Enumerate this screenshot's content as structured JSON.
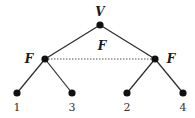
{
  "diagram": {
    "type": "tree",
    "root": {
      "id": "root",
      "label": "V",
      "x": 100,
      "y": 25,
      "label_x": 100,
      "label_y": 16
    },
    "internal": [
      {
        "id": "left",
        "label": "F",
        "x": 45,
        "y": 59,
        "label_x": 29,
        "label_y": 63
      },
      {
        "id": "right",
        "label": "F",
        "x": 155,
        "y": 59,
        "label_x": 171,
        "label_y": 63
      }
    ],
    "dotted_edge": {
      "from": "left",
      "to": "right",
      "label": "F",
      "label_x": 102,
      "label_y": 49
    },
    "leaves": [
      {
        "id": "l1",
        "label": "1",
        "parent": "left",
        "x": 17,
        "y": 93,
        "label_x": 17,
        "label_y": 111
      },
      {
        "id": "l3",
        "label": "3",
        "parent": "left",
        "x": 72,
        "y": 93,
        "label_x": 72,
        "label_y": 111
      },
      {
        "id": "l2",
        "label": "2",
        "parent": "right",
        "x": 127,
        "y": 93,
        "label_x": 127,
        "label_y": 111
      },
      {
        "id": "l4",
        "label": "4",
        "parent": "right",
        "x": 183,
        "y": 93,
        "label_x": 183,
        "label_y": 111
      }
    ]
  }
}
